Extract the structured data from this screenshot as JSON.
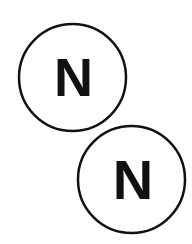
{
  "diagram": {
    "colors": {
      "background": "#ffffff",
      "stroke": "#111111",
      "text": "#111111"
    },
    "atoms": [
      {
        "symbol": "N",
        "cx": 72.5,
        "cy": 77.5,
        "r": 53.5
      },
      {
        "symbol": "N",
        "cx": 131.5,
        "cy": 179.5,
        "r": 53.5
      }
    ]
  }
}
